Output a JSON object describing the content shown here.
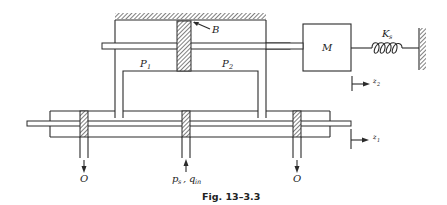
{
  "figure": {
    "caption": "Fig. 13–3.3",
    "labels": {
      "piston_b": "B",
      "chamber_1": {
        "base": "P",
        "sub": "1"
      },
      "chamber_2": {
        "base": "P",
        "sub": "2"
      },
      "mass": "M",
      "spring": {
        "base": "K",
        "sub": "s"
      },
      "disp_2": {
        "base": "z",
        "sub": "2"
      },
      "disp_1": {
        "base": "z",
        "sub": "1"
      },
      "outlet_left": "O",
      "outlet_right": "O",
      "supply": {
        "p": "p",
        "p_sub": "s",
        "sep": ",",
        "q": "q",
        "q_sub": "in"
      }
    },
    "colors": {
      "line": "#2a2a2a",
      "background": "#ffffff"
    }
  }
}
